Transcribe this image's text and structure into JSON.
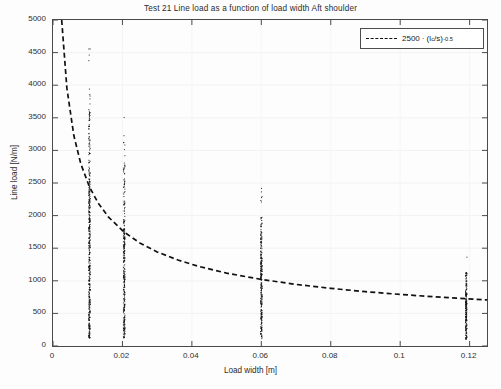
{
  "chart_data": {
    "type": "scatter",
    "title": "Test 21  Line load as a function of load width Aft shoulder",
    "xlabel": "Load width [m]",
    "ylabel": "Line load [N/m]",
    "xlim": [
      0,
      0.125
    ],
    "ylim": [
      0,
      5000
    ],
    "xticks": [
      0,
      0.02,
      0.04,
      0.06,
      0.08,
      0.1,
      0.12
    ],
    "xtick_labels": [
      "0",
      "0.02",
      "0.04",
      "0.06",
      "0.08",
      "0.1",
      "0.12"
    ],
    "yticks": [
      0,
      500,
      1000,
      1500,
      2000,
      2500,
      3000,
      3500,
      4000,
      4500,
      5000
    ],
    "ytick_labels": [
      "0",
      "500",
      "1000",
      "1500",
      "2000",
      "2500",
      "3000",
      "3500",
      "4000",
      "4500",
      "5000"
    ],
    "grid": false,
    "legend_position": "top-right",
    "series": [
      {
        "name": "measurements",
        "type": "scatter",
        "marker": "dot",
        "color": "#111111",
        "clusters": [
          {
            "x": 0.0105,
            "y_min": 120,
            "y_max": 4600,
            "y_dense_max": 2450,
            "n": 420
          },
          {
            "x": 0.0205,
            "y_min": 120,
            "y_max": 3600,
            "y_dense_max": 1800,
            "n": 300
          },
          {
            "x": 0.06,
            "y_min": 110,
            "y_max": 2420,
            "y_dense_max": 1450,
            "n": 260
          },
          {
            "x": 0.119,
            "y_min": 100,
            "y_max": 1400,
            "y_dense_max": 820,
            "n": 200
          }
        ]
      },
      {
        "name": "fit-curve",
        "type": "line",
        "style": "dashed",
        "color": "#111111",
        "equation_coefficient": 2500,
        "equation_exponent": -0.5,
        "label_prefix": "2500",
        "label_dot": "·",
        "label_base_open": "(l",
        "label_subscript": "c",
        "label_base_close": "/s)",
        "label_exponent": "-0.5",
        "points_x": [
          0.0025,
          0.004,
          0.006,
          0.008,
          0.0105,
          0.013,
          0.016,
          0.0205,
          0.025,
          0.03,
          0.036,
          0.042,
          0.05,
          0.06,
          0.07,
          0.08,
          0.09,
          0.1,
          0.11,
          0.119,
          0.125
        ],
        "points_y": [
          5000,
          3953,
          3228,
          2795,
          2440,
          2193,
          1976,
          1746,
          1581,
          1443,
          1318,
          1220,
          1118,
          1021,
          945,
          884,
          833,
          791,
          754,
          725,
          707
        ]
      }
    ]
  },
  "legend": {
    "entry_label": "2500 · (l_c/s)^-0.5"
  }
}
